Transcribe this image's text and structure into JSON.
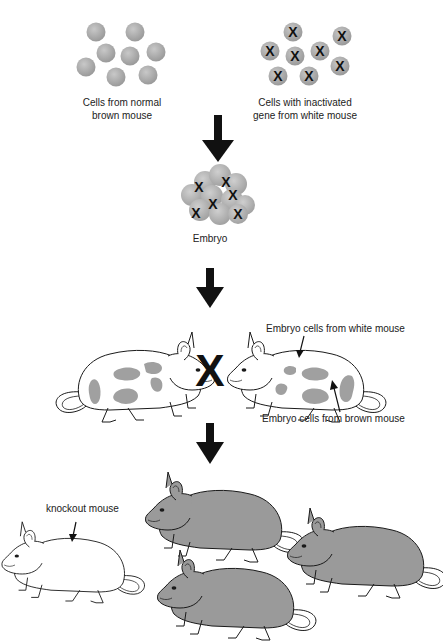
{
  "diagram": {
    "colors": {
      "cell_fill": "#a6a6a6",
      "cell_highlight": "#c4c4c4",
      "brown_mouse_fill": "#9a9a9a",
      "patch_fill": "#a0a0a0",
      "outline": "#1a1a1a",
      "arrow": "#111111",
      "background": "#ffffff"
    },
    "stage1": {
      "normal_cells": {
        "label": "Cells from normal\nbrown mouse",
        "label_line1": "Cells from normal",
        "label_line2": "brown mouse",
        "count": 8
      },
      "inactivated_cells": {
        "label_line1": "Cells with inactivated",
        "label_line2": "gene from white mouse",
        "count": 8,
        "marker": "X"
      }
    },
    "stage2": {
      "embryo_label": "Embryo",
      "marker": "X"
    },
    "stage3": {
      "cross_symbol": "X",
      "annotation_white": "Embryo cells from white mouse",
      "annotation_brown": "Embryo cells from brown mouse"
    },
    "stage4": {
      "knockout_label": "knockout mouse",
      "offspring_brown_count": 3,
      "offspring_white_count": 1
    },
    "arrows": [
      {
        "name": "arrow-cells-to-embryo"
      },
      {
        "name": "arrow-embryo-to-chimeras"
      },
      {
        "name": "arrow-chimeras-to-offspring"
      }
    ]
  }
}
